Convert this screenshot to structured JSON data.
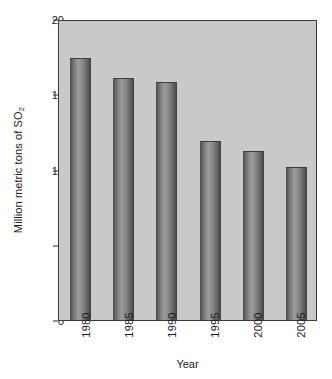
{
  "chart_data": {
    "type": "bar",
    "title": "",
    "xlabel": "Year",
    "ylabel_text": "Million metric tons of SO",
    "ylabel_sub": "2",
    "ylabel_full": "Million metric tons of SO2",
    "categories": [
      "1980",
      "1985",
      "1990",
      "1995",
      "2000",
      "2005"
    ],
    "values": [
      17.4,
      16.1,
      15.8,
      11.9,
      11.2,
      10.2
    ],
    "ylim": [
      0,
      20
    ],
    "yticks": [
      0,
      5,
      10,
      15,
      20
    ],
    "ytick_labels": [
      "0",
      "5",
      "10",
      "15",
      "20"
    ],
    "grid": false,
    "legend": null,
    "bar_color": "#8a8a8a",
    "plot_background": "#c9c9c9",
    "axis_color": "#3a3a3a",
    "xtick_rotation": -90
  }
}
